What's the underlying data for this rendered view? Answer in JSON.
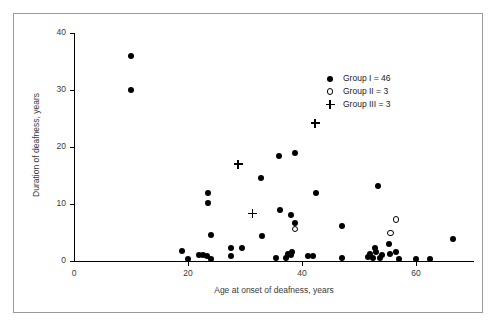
{
  "chart_data": {
    "type": "scatter",
    "title": "",
    "xlabel": "Age at onset of deafness, years",
    "ylabel": "Duration of deafness, years",
    "xlim": [
      0,
      70
    ],
    "ylim": [
      0,
      40
    ],
    "xticks": [
      0,
      20,
      40,
      60
    ],
    "yticks": [
      0,
      10,
      20,
      30,
      40
    ],
    "grid": false,
    "legend_position": "upper right",
    "series": [
      {
        "name": "Group I = 46",
        "marker": "filled-circle",
        "count": 46,
        "points": [
          [
            10,
            36.0
          ],
          [
            10,
            30.0
          ],
          [
            19,
            1.7
          ],
          [
            20,
            0.4
          ],
          [
            22,
            1.0
          ],
          [
            22.6,
            1.0
          ],
          [
            23.4,
            0.8
          ],
          [
            24,
            0.4
          ],
          [
            23.5,
            12.0
          ],
          [
            23.5,
            10.2
          ],
          [
            24,
            4.6
          ],
          [
            27.5,
            2.3
          ],
          [
            27.5,
            0.9
          ],
          [
            29.5,
            2.3
          ],
          [
            32.8,
            14.6
          ],
          [
            33,
            4.4
          ],
          [
            36,
            18.4
          ],
          [
            36.2,
            8.9
          ],
          [
            37.5,
            1.2
          ],
          [
            37.2,
            0.6
          ],
          [
            38,
            1.0
          ],
          [
            38.2,
            1.6
          ],
          [
            38,
            8.0
          ],
          [
            38.8,
            19.0
          ],
          [
            38.8,
            6.6
          ],
          [
            41,
            0.9
          ],
          [
            42,
            0.9
          ],
          [
            42.5,
            12.0
          ],
          [
            47,
            0.6
          ],
          [
            47,
            6.2
          ],
          [
            51.5,
            0.7
          ],
          [
            52,
            1.2
          ],
          [
            52.5,
            0.6
          ],
          [
            52.8,
            2.3
          ],
          [
            53,
            1.5
          ],
          [
            53.3,
            13.1
          ],
          [
            53.6,
            0.5
          ],
          [
            54,
            1.1
          ],
          [
            55.2,
            2.9
          ],
          [
            55.5,
            1.3
          ],
          [
            56.5,
            1.6
          ],
          [
            57,
            0.4
          ],
          [
            60,
            0.3
          ],
          [
            62.5,
            0.4
          ],
          [
            66.5,
            3.8
          ],
          [
            35.5,
            0.5
          ]
        ]
      },
      {
        "name": "Group II = 3",
        "marker": "open-circle",
        "count": 3,
        "points": [
          [
            38.8,
            5.6
          ],
          [
            55.5,
            4.9
          ],
          [
            56.5,
            7.3
          ]
        ]
      },
      {
        "name": "Group III = 3",
        "marker": "plus",
        "count": 3,
        "points": [
          [
            28.8,
            17.0
          ],
          [
            31.3,
            8.3
          ],
          [
            42.3,
            24.2
          ]
        ]
      }
    ]
  },
  "axes": {
    "x_title": "Age at onset of deafness, years",
    "y_title": "Duration of deafness, years",
    "x_tick_labels": [
      "0",
      "20",
      "40",
      "60"
    ],
    "y_tick_labels": [
      "0",
      "10",
      "20",
      "30",
      "40"
    ]
  },
  "legend": {
    "entries": [
      {
        "label": "Group I = 46",
        "marker": "filled-circle"
      },
      {
        "label": "Group II = 3",
        "marker": "open-circle"
      },
      {
        "label": "Group III = 3",
        "marker": "plus"
      }
    ]
  },
  "colors": {
    "marker": "#000000",
    "axis": "#000000",
    "text": "#3a3a3a",
    "frame": "#9a9a9a",
    "background": "#ffffff"
  }
}
